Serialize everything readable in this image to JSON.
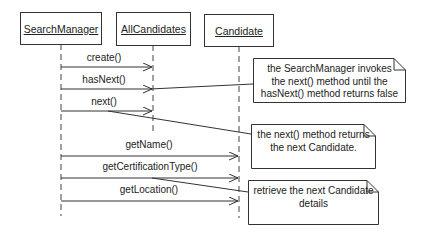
{
  "diagram": {
    "type": "sequence",
    "objects": [
      {
        "id": "searchmanager",
        "label": "SearchManager"
      },
      {
        "id": "allcandidates",
        "label": "AllCandidates"
      },
      {
        "id": "candidate",
        "label": "Candidate"
      }
    ],
    "messages": [
      {
        "label": "create()",
        "from": "SearchManager",
        "to": "AllCandidates"
      },
      {
        "label": "hasNext()",
        "from": "SearchManager",
        "to": "AllCandidates"
      },
      {
        "label": "next()",
        "from": "SearchManager",
        "to": "AllCandidates"
      },
      {
        "label": "getName()",
        "from": "SearchManager",
        "to": "Candidate"
      },
      {
        "label": "getCertificationType()",
        "from": "SearchManager",
        "to": "Candidate"
      },
      {
        "label": "getLocation()",
        "from": "SearchManager",
        "to": "Candidate"
      }
    ],
    "notes": [
      {
        "text": "the SearchManager invokes\nthe next() method until the\nhasNext() method returns false",
        "attached_to": "hasNext()"
      },
      {
        "text": "the next() method returns\nthe next Candidate.",
        "attached_to": "next()"
      },
      {
        "text": "retrieve the next Candidate\ndetails",
        "attached_to": "getCertificationType()"
      }
    ]
  }
}
